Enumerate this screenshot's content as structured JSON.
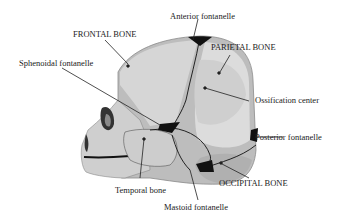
{
  "diagram": {
    "colors": {
      "background": "#ffffff",
      "bone_light": "#d9d9d9",
      "bone_mid": "#bdbdbd",
      "bone_dark": "#9e9e9e",
      "suture": "#111111",
      "leader": "#222222",
      "text": "#222222"
    },
    "labels": {
      "anterior_fontanelle": "Anterior fontanelle",
      "frontal_bone": "FRONTAL BONE",
      "parietal_bone": "PARIETAL BONE",
      "sphenoidal_fontanelle": "Sphenoidal fontanelle",
      "ossification_center": "Ossification center",
      "posterior_fontanelle": "Posterior fontanelle",
      "occipital_bone": "OCCIPITAL BONE",
      "temporal_bone": "Temporal bone",
      "mastoid_fontanelle": "Mastoid fontanelle"
    }
  }
}
